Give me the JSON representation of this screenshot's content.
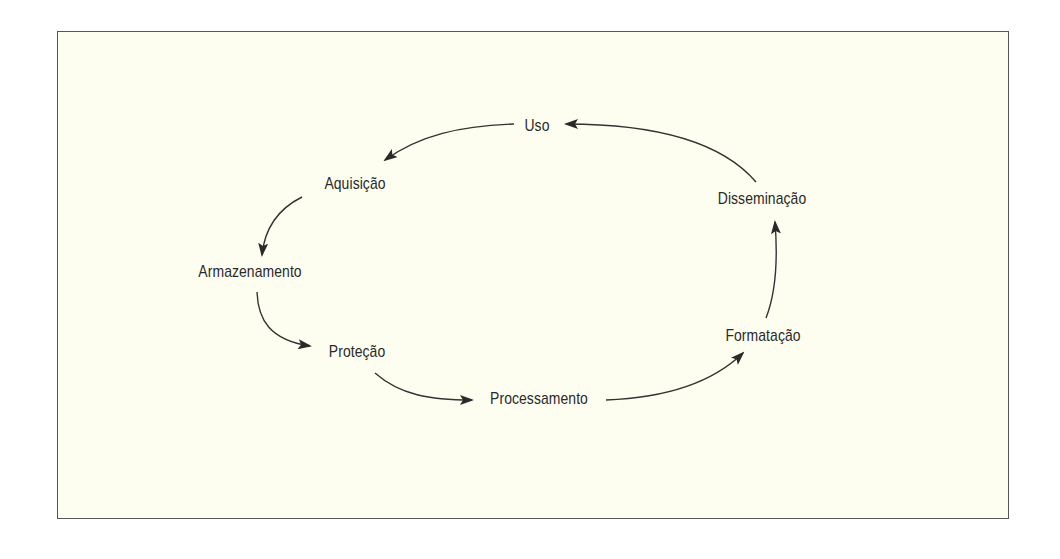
{
  "diagram": {
    "type": "cycle",
    "background_color": "#fefef0",
    "border_color": "#555555",
    "text_color": "#2a2a2a",
    "nodes": [
      {
        "id": "uso",
        "label": "Uso"
      },
      {
        "id": "aquisicao",
        "label": "Aquisição"
      },
      {
        "id": "armazenamento",
        "label": "Armazenamento"
      },
      {
        "id": "protecao",
        "label": "Proteção"
      },
      {
        "id": "processamento",
        "label": "Processamento"
      },
      {
        "id": "formatacao",
        "label": "Formatação"
      },
      {
        "id": "disseminacao",
        "label": "Disseminação"
      }
    ],
    "edges": [
      {
        "from": "uso",
        "to": "aquisicao"
      },
      {
        "from": "aquisicao",
        "to": "armazenamento"
      },
      {
        "from": "armazenamento",
        "to": "protecao"
      },
      {
        "from": "protecao",
        "to": "processamento"
      },
      {
        "from": "processamento",
        "to": "formatacao"
      },
      {
        "from": "formatacao",
        "to": "disseminacao"
      },
      {
        "from": "disseminacao",
        "to": "uso"
      }
    ]
  }
}
